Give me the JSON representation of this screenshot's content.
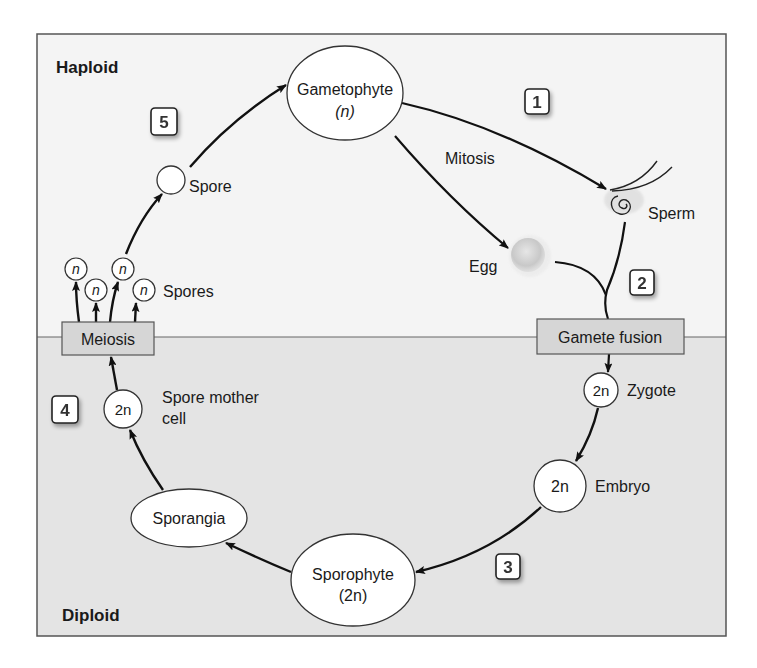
{
  "regions": {
    "haploid": {
      "label": "Haploid",
      "color": "#f4f4f4"
    },
    "diploid": {
      "label": "Diploid",
      "color": "#e4e4e4"
    }
  },
  "nodes": {
    "gametophyte": {
      "label": "Gametophyte",
      "ploidy": "(n)"
    },
    "spore": {
      "label": "Spore"
    },
    "spores": {
      "label": "Spores",
      "ploidy_symbols": [
        "n",
        "n",
        "n",
        "n"
      ]
    },
    "meiosis": {
      "label": "Meiosis"
    },
    "spore_mother_cell": {
      "label_line1": "Spore mother",
      "label_line2": "cell",
      "ploidy": "2n"
    },
    "sporangia": {
      "label": "Sporangia"
    },
    "sporophyte": {
      "label": "Sporophyte",
      "ploidy": "(2n)"
    },
    "embryo": {
      "label": "Embryo",
      "ploidy": "2n"
    },
    "zygote": {
      "label": "Zygote",
      "ploidy": "2n"
    },
    "gamete_fusion": {
      "label": "Gamete fusion"
    },
    "egg": {
      "label": "Egg"
    },
    "sperm": {
      "label": "Sperm"
    }
  },
  "edge_labels": {
    "mitosis": "Mitosis"
  },
  "steps": [
    {
      "number": "1"
    },
    {
      "number": "2"
    },
    {
      "number": "3"
    },
    {
      "number": "4"
    },
    {
      "number": "5"
    }
  ],
  "colors": {
    "frame": "#555555",
    "box_fill": "#d6d6d6",
    "node_fill": "#ffffff",
    "arrow": "#111111"
  }
}
